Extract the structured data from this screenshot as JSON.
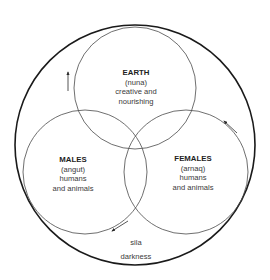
{
  "diagram": {
    "type": "venn-cosmology",
    "colors": {
      "outer_stroke": "#1a1a1a",
      "inner_stroke": "#4a4a4a",
      "text": "#3a3a3a",
      "title_text": "#1e1e1e",
      "background": "#ffffff"
    },
    "outer_circle": {
      "label": "sila",
      "sublabel": "darkness"
    },
    "circles": [
      {
        "id": "earth",
        "title": "EARTH",
        "native_term": "(nuna)",
        "line1": "creative and",
        "line2": "nourishing"
      },
      {
        "id": "males",
        "title": "MALES",
        "native_term": "(angut)",
        "line1": "humans",
        "line2": "and animals"
      },
      {
        "id": "females",
        "title": "FEMALES",
        "native_term": "(arnaq)",
        "line1": "humans",
        "line2": "and animals"
      }
    ],
    "arrows": [
      {
        "id": "left-arrow",
        "direction": "up"
      },
      {
        "id": "right-arrow",
        "direction": "up-left"
      },
      {
        "id": "bottom-arrow",
        "direction": "down-left"
      }
    ]
  }
}
